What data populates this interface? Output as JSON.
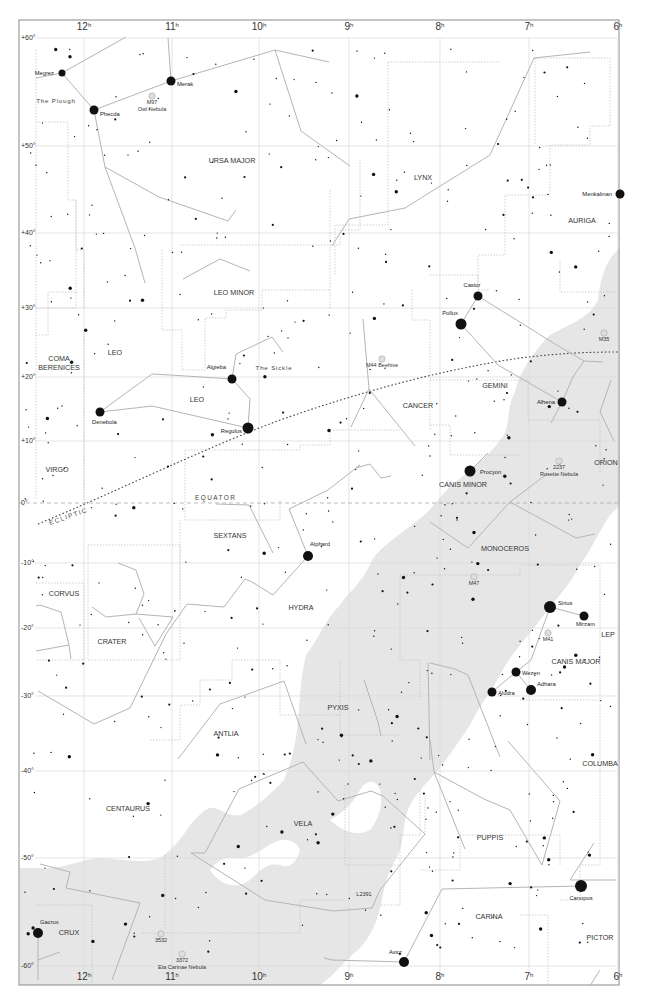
{
  "map": {
    "type": "star chart",
    "frame": {
      "left": 19,
      "top": 20,
      "right": 619,
      "bottom": 985
    },
    "colors": {
      "background": "#ffffff",
      "frame": "#8a8a8a",
      "grid": "#d8d8d8",
      "boundary": "#b8b8b8",
      "stick": "#b0b0b0",
      "star": "#111111",
      "milky_way": "#e6e6e6",
      "label": "#333333",
      "ecliptic": "#444444",
      "equator": "#aaaaaa"
    },
    "ra_ticks": [
      {
        "label": "12",
        "x": 84
      },
      {
        "label": "11",
        "x": 172
      },
      {
        "label": "10",
        "x": 259
      },
      {
        "label": "9",
        "x": 349
      },
      {
        "label": "8",
        "x": 440
      },
      {
        "label": "7",
        "x": 529
      },
      {
        "label": "6",
        "x": 618
      }
    ],
    "ra_unit": "h",
    "dec_ticks": [
      {
        "label": "+60°",
        "y": 38
      },
      {
        "label": "+50°",
        "y": 146
      },
      {
        "label": "+40°",
        "y": 233
      },
      {
        "label": "+30°",
        "y": 308
      },
      {
        "label": "+20°",
        "y": 377
      },
      {
        "label": "+10°",
        "y": 441
      },
      {
        "label": "0°",
        "y": 503
      },
      {
        "label": "-10°",
        "y": 563
      },
      {
        "label": "-20°",
        "y": 628
      },
      {
        "label": "-30°",
        "y": 696
      },
      {
        "label": "-40°",
        "y": 771
      },
      {
        "label": "-50°",
        "y": 858
      },
      {
        "label": "-60°",
        "y": 966
      }
    ],
    "special_lines": {
      "equator_label": "EQUATOR",
      "ecliptic_label": "ECLIPTIC"
    },
    "constellations": [
      {
        "name": "URSA MAJOR",
        "x": 232,
        "y": 163
      },
      {
        "name": "LYNX",
        "x": 423,
        "y": 180
      },
      {
        "name": "AURIGA",
        "x": 582,
        "y": 223
      },
      {
        "name": "LEO MINOR",
        "x": 234,
        "y": 295
      },
      {
        "name": "COMA",
        "x": 59,
        "y": 361
      },
      {
        "name": "BERENICES",
        "x": 59,
        "y": 370
      },
      {
        "name": "LEO",
        "x": 115,
        "y": 355
      },
      {
        "name": "LEO",
        "x": 197,
        "y": 402
      },
      {
        "name": "GEMINI",
        "x": 495,
        "y": 388
      },
      {
        "name": "CANCER",
        "x": 418,
        "y": 408
      },
      {
        "name": "ORION",
        "x": 606,
        "y": 465
      },
      {
        "name": "CANIS MINOR",
        "x": 463,
        "y": 487
      },
      {
        "name": "VIRGO",
        "x": 57,
        "y": 472
      },
      {
        "name": "SEXTANS",
        "x": 230,
        "y": 538
      },
      {
        "name": "MONOCEROS",
        "x": 505,
        "y": 551
      },
      {
        "name": "CORVUS",
        "x": 64,
        "y": 596
      },
      {
        "name": "HYDRA",
        "x": 301,
        "y": 610
      },
      {
        "name": "CRATER",
        "x": 112,
        "y": 644
      },
      {
        "name": "LEP",
        "x": 608,
        "y": 637
      },
      {
        "name": "CANIS MAJOR",
        "x": 576,
        "y": 664
      },
      {
        "name": "PYXIS",
        "x": 338,
        "y": 710
      },
      {
        "name": "ANTLIA",
        "x": 226,
        "y": 736
      },
      {
        "name": "COLUMBA",
        "x": 600,
        "y": 766
      },
      {
        "name": "CENTAURUS",
        "x": 128,
        "y": 811
      },
      {
        "name": "VELA",
        "x": 303,
        "y": 826
      },
      {
        "name": "PUPPIS",
        "x": 490,
        "y": 840
      },
      {
        "name": "CARINA",
        "x": 489,
        "y": 919
      },
      {
        "name": "CRUX",
        "x": 69,
        "y": 935
      },
      {
        "name": "PICTOR",
        "x": 600,
        "y": 940
      }
    ],
    "named_stars": [
      {
        "name": "Megrez",
        "x": 62,
        "y": 73,
        "r": 3.5,
        "anchor": "end",
        "lx": -8,
        "ly": 2
      },
      {
        "name": "Merak",
        "x": 171,
        "y": 81,
        "r": 4.5,
        "anchor": "start",
        "lx": 6,
        "ly": 5
      },
      {
        "name": "Phecda",
        "x": 94,
        "y": 110,
        "r": 4.5,
        "anchor": "start",
        "lx": 6,
        "ly": 6
      },
      {
        "name": "Menkalinan",
        "x": 620,
        "y": 194,
        "r": 4.5,
        "anchor": "end",
        "lx": -8,
        "ly": 2
      },
      {
        "name": "Castor",
        "x": 478,
        "y": 296,
        "r": 4.5,
        "anchor": "middle",
        "lx": -6,
        "ly": -9
      },
      {
        "name": "Pollux",
        "x": 461,
        "y": 324,
        "r": 5.5,
        "anchor": "end",
        "lx": -3,
        "ly": -9
      },
      {
        "name": "Algieba",
        "x": 232,
        "y": 379,
        "r": 4.5,
        "anchor": "end",
        "lx": -6,
        "ly": -10
      },
      {
        "name": "Denebola",
        "x": 100,
        "y": 412,
        "r": 4.5,
        "anchor": "start",
        "lx": -8,
        "ly": 12
      },
      {
        "name": "Regulus",
        "x": 248,
        "y": 428,
        "r": 5.5,
        "anchor": "end",
        "lx": -6,
        "ly": 5
      },
      {
        "name": "Alhena",
        "x": 562,
        "y": 402,
        "r": 4.5,
        "anchor": "end",
        "lx": -7,
        "ly": 2
      },
      {
        "name": "Procyon",
        "x": 470,
        "y": 471,
        "r": 5.5,
        "anchor": "start",
        "lx": 10,
        "ly": 3
      },
      {
        "name": "Alphard",
        "x": 308,
        "y": 556,
        "r": 5,
        "anchor": "start",
        "lx": 2,
        "ly": -10
      },
      {
        "name": "Sirius",
        "x": 550,
        "y": 607,
        "r": 6,
        "anchor": "start",
        "lx": 8,
        "ly": -2
      },
      {
        "name": "Mirzam",
        "x": 584,
        "y": 616,
        "r": 4.5,
        "anchor": "start",
        "lx": -8,
        "ly": 10
      },
      {
        "name": "Wezen",
        "x": 516,
        "y": 672,
        "r": 4.5,
        "anchor": "start",
        "lx": 6,
        "ly": 3
      },
      {
        "name": "Adhara",
        "x": 531,
        "y": 690,
        "r": 5,
        "anchor": "start",
        "lx": 6,
        "ly": -4
      },
      {
        "name": "Aludra",
        "x": 492,
        "y": 692,
        "r": 4.5,
        "anchor": "start",
        "lx": 6,
        "ly": 3
      },
      {
        "name": "Canopus",
        "x": 581,
        "y": 886,
        "r": 6,
        "anchor": "middle",
        "lx": 0,
        "ly": 14
      },
      {
        "name": "Avior",
        "x": 404,
        "y": 962,
        "r": 5,
        "anchor": "end",
        "lx": -2,
        "ly": -8
      },
      {
        "name": "Gacrux",
        "x": 38,
        "y": 933,
        "r": 5,
        "anchor": "start",
        "lx": 2,
        "ly": -9
      }
    ],
    "deep_sky": [
      {
        "name": "M97",
        "x": 152,
        "y": 104,
        "sub": "Owl Nebula"
      },
      {
        "name": "M44 Beehive",
        "x": 382,
        "y": 367
      },
      {
        "name": "M35",
        "x": 604,
        "y": 341
      },
      {
        "name": "2237",
        "x": 559,
        "y": 469,
        "sub": "Rosette Nebula"
      },
      {
        "name": "M47",
        "x": 474,
        "y": 585
      },
      {
        "name": "M41",
        "x": 548,
        "y": 641
      },
      {
        "name": "3532",
        "x": 161,
        "y": 942
      },
      {
        "name": "3372",
        "x": 182,
        "y": 962,
        "sub": "Eta Carinae Nebula"
      }
    ],
    "asterisms": [
      {
        "name": "The Plough",
        "x": 56,
        "y": 103
      },
      {
        "name": "The Sickle",
        "x": 274,
        "y": 370
      }
    ],
    "other_labels": [
      {
        "text": "L2391",
        "x": 364,
        "y": 896
      }
    ]
  }
}
